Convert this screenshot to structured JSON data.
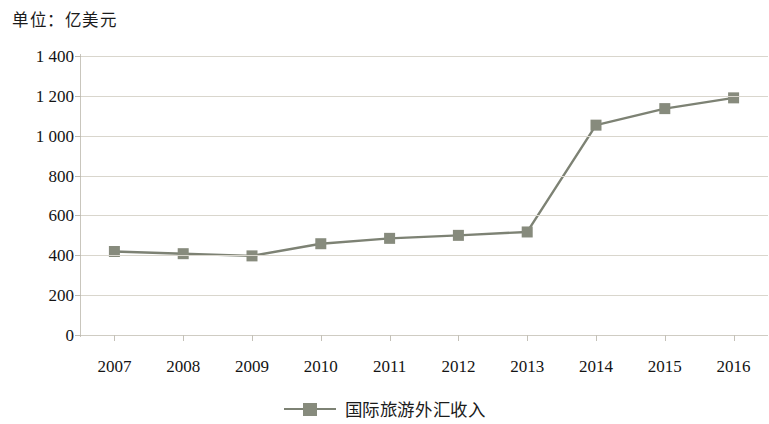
{
  "unit_caption": "单位：亿美元",
  "legend": {
    "label": "国际旅游外汇收入",
    "marker_color": "#878b7d",
    "line_color": "#7d8274"
  },
  "axis": {
    "y_ticks": [
      "1 400",
      "1 200",
      "1 000",
      "800",
      "600",
      "400",
      "200",
      "0"
    ],
    "x_ticks": [
      "2007",
      "2008",
      "2009",
      "2010",
      "2011",
      "2012",
      "2013",
      "2014",
      "2015",
      "2016"
    ]
  },
  "chart_data": {
    "type": "line",
    "title": "单位：亿美元",
    "xlabel": "",
    "ylabel": "亿美元",
    "categories": [
      "2007",
      "2008",
      "2009",
      "2010",
      "2011",
      "2012",
      "2013",
      "2014",
      "2015",
      "2016"
    ],
    "series": [
      {
        "name": "国际旅游外汇收入",
        "values": [
          419,
          408,
          397,
          458,
          485,
          500,
          517,
          1053,
          1136,
          1190
        ],
        "color": "#7d8274",
        "marker": "square",
        "marker_color": "#878b7d"
      }
    ],
    "ylim": [
      0,
      1400
    ],
    "ytick_values": [
      0,
      200,
      400,
      600,
      800,
      1000,
      1200,
      1400
    ],
    "ytick_labels": [
      "0",
      "200",
      "400",
      "600",
      "800",
      "1 000",
      "1 200",
      "1 400"
    ],
    "grid": true,
    "grid_axis": "y",
    "legend_position": "bottom-center"
  }
}
